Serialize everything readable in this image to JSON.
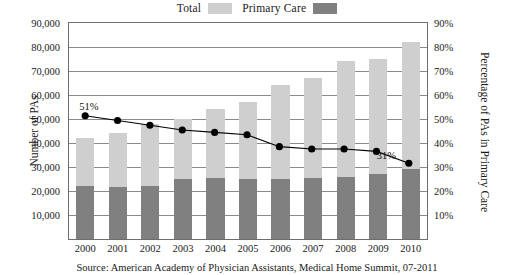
{
  "legend": {
    "items": [
      {
        "label": "Total",
        "color": "#cfcfcf"
      },
      {
        "label": "Primary Care",
        "color": "#808080"
      }
    ]
  },
  "axes": {
    "left_title": "Number of PAs",
    "right_title": "Percentage of PAs in Primary Care",
    "left_ticks": [
      "90,000",
      "80,000",
      "70,000",
      "60,000",
      "50,000",
      "40,000",
      "30,000",
      "20,000",
      "10,000"
    ],
    "right_ticks": [
      "90%",
      "80%",
      "70%",
      "60%",
      "50%",
      "40%",
      "30%",
      "20%",
      "10%"
    ]
  },
  "annotations": {
    "first_point": "51%",
    "last_point": "31%"
  },
  "source": {
    "text": "Source: American Academy of Physician Assistants, Medical Home Summit, 07-2011"
  },
  "chart_data": {
    "type": "bar",
    "title": "",
    "subtitle": "",
    "xlabel": "",
    "ylabel": "Number of PAs",
    "y2label": "Percentage of PAs in Primary Care",
    "categories": [
      "2000",
      "2001",
      "2002",
      "2003",
      "2004",
      "2005",
      "2006",
      "2007",
      "2008",
      "2009",
      "2010"
    ],
    "ylim": [
      0,
      90000
    ],
    "y2lim": [
      0,
      90
    ],
    "grid": true,
    "legend_position": "top-center",
    "series": [
      {
        "name": "Total",
        "type": "bar",
        "color": "#cfcfcf",
        "axis": "left",
        "values": [
          42000,
          44000,
          48000,
          50000,
          54000,
          57000,
          64000,
          67000,
          74000,
          75000,
          82000
        ]
      },
      {
        "name": "Primary Care",
        "type": "bar",
        "color": "#808080",
        "axis": "left",
        "values": [
          22000,
          21500,
          22000,
          25000,
          25500,
          25000,
          25000,
          25500,
          26000,
          27000,
          29000
        ]
      },
      {
        "name": "Percentage of PAs in Primary Care",
        "type": "line",
        "color": "#000000",
        "axis": "right",
        "values": [
          51,
          49,
          47,
          45,
          44,
          43,
          38,
          37,
          37,
          36,
          31
        ]
      }
    ]
  }
}
